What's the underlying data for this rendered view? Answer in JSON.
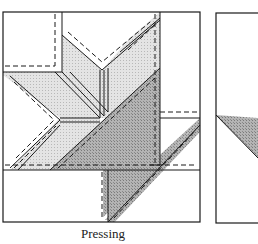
{
  "figure": {
    "caption": "Pressing",
    "panels": [
      {
        "name": "main-panel",
        "description": "Quilt block seams pressed, with shaded patches and dashed seam lines"
      },
      {
        "name": "right-panel",
        "description": "Partially visible block with shaded triangle"
      }
    ],
    "colors": {
      "line": "#1a1a1a",
      "light_shade": "#d9d9d9",
      "dark_shade": "#a8a8a8",
      "background": "#ffffff"
    }
  }
}
